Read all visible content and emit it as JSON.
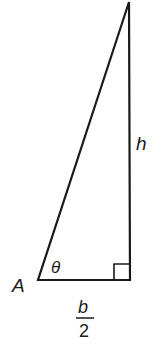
{
  "diagram": {
    "type": "right-triangle",
    "colors": {
      "stroke": "#1a1a1a",
      "background": "#ffffff"
    },
    "vertices": {
      "A": {
        "label": "A",
        "x": 38,
        "y": 280
      },
      "right_angle": {
        "x": 130,
        "y": 280
      },
      "apex": {
        "x": 129,
        "y": 2
      }
    },
    "labels": {
      "vertex_a": "A",
      "angle": "θ",
      "height": "h",
      "base_numerator": "b",
      "base_denominator": "2"
    },
    "right_angle_marker": true
  }
}
